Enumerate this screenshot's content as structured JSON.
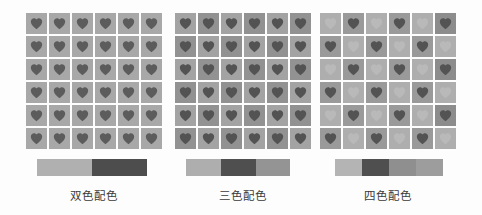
{
  "figure": {
    "background_color": "#fdfdfd",
    "grid_rows": 6,
    "grid_cols": 6,
    "icon_name": "heart-icon"
  },
  "panels": [
    {
      "id": "two-color",
      "caption": "双色配色",
      "left": 26,
      "grid_width": 136,
      "swatch_left": 37,
      "swatch_width": 110,
      "palette": [
        "#b0b0b0",
        "#4d4d4d"
      ],
      "swatch_labels": [
        "浅灰",
        "深灰"
      ],
      "swatches": [
        {
          "color": "#b0b0b0",
          "width": 55
        },
        {
          "color": "#4d4d4d",
          "width": 55
        }
      ],
      "tile_bg": [
        [
          "#a8a8a8",
          "#a8a8a8",
          "#a8a8a8",
          "#a8a8a8",
          "#a8a8a8",
          "#a8a8a8"
        ],
        [
          "#a8a8a8",
          "#a8a8a8",
          "#a8a8a8",
          "#a8a8a8",
          "#a8a8a8",
          "#a8a8a8"
        ],
        [
          "#a8a8a8",
          "#a8a8a8",
          "#a8a8a8",
          "#a8a8a8",
          "#a8a8a8",
          "#a8a8a8"
        ],
        [
          "#a8a8a8",
          "#a8a8a8",
          "#a8a8a8",
          "#a8a8a8",
          "#a8a8a8",
          "#a8a8a8"
        ],
        [
          "#a8a8a8",
          "#a8a8a8",
          "#a8a8a8",
          "#a8a8a8",
          "#a8a8a8",
          "#a8a8a8"
        ],
        [
          "#a8a8a8",
          "#a8a8a8",
          "#a8a8a8",
          "#a8a8a8",
          "#a8a8a8",
          "#a8a8a8"
        ]
      ],
      "heart_color": [
        [
          "#5c5c5c",
          "#5c5c5c",
          "#5c5c5c",
          "#5c5c5c",
          "#5c5c5c",
          "#5c5c5c"
        ],
        [
          "#5c5c5c",
          "#5c5c5c",
          "#5c5c5c",
          "#5c5c5c",
          "#5c5c5c",
          "#5c5c5c"
        ],
        [
          "#5c5c5c",
          "#5c5c5c",
          "#5c5c5c",
          "#5c5c5c",
          "#5c5c5c",
          "#5c5c5c"
        ],
        [
          "#5c5c5c",
          "#5c5c5c",
          "#5c5c5c",
          "#5c5c5c",
          "#5c5c5c",
          "#5c5c5c"
        ],
        [
          "#5c5c5c",
          "#5c5c5c",
          "#5c5c5c",
          "#5c5c5c",
          "#5c5c5c",
          "#5c5c5c"
        ],
        [
          "#5c5c5c",
          "#5c5c5c",
          "#5c5c5c",
          "#5c5c5c",
          "#5c5c5c",
          "#5c5c5c"
        ]
      ]
    },
    {
      "id": "three-color",
      "caption": "三色配色",
      "left": 175,
      "grid_width": 136,
      "swatch_left": 186,
      "swatch_width": 104,
      "palette": [
        "#aeaeae",
        "#4f4f4f",
        "#949494"
      ],
      "swatch_labels": [
        "浅灰",
        "深灰",
        "中灰"
      ],
      "swatches": [
        {
          "color": "#aeaeae",
          "width": 35
        },
        {
          "color": "#4f4f4f",
          "width": 35
        },
        {
          "color": "#949494",
          "width": 34
        }
      ],
      "tile_bg": [
        [
          "#a3a3a3",
          "#929292",
          "#a3a3a3",
          "#929292",
          "#a3a3a3",
          "#929292"
        ],
        [
          "#929292",
          "#a3a3a3",
          "#929292",
          "#a3a3a3",
          "#929292",
          "#a3a3a3"
        ],
        [
          "#a3a3a3",
          "#929292",
          "#a3a3a3",
          "#929292",
          "#a3a3a3",
          "#929292"
        ],
        [
          "#929292",
          "#a3a3a3",
          "#929292",
          "#a3a3a3",
          "#929292",
          "#a3a3a3"
        ],
        [
          "#a3a3a3",
          "#929292",
          "#a3a3a3",
          "#929292",
          "#a3a3a3",
          "#929292"
        ],
        [
          "#929292",
          "#a3a3a3",
          "#929292",
          "#a3a3a3",
          "#929292",
          "#a3a3a3"
        ]
      ],
      "heart_color": [
        [
          "#535353",
          "#535353",
          "#535353",
          "#535353",
          "#535353",
          "#535353"
        ],
        [
          "#535353",
          "#535353",
          "#535353",
          "#535353",
          "#535353",
          "#535353"
        ],
        [
          "#535353",
          "#535353",
          "#535353",
          "#535353",
          "#535353",
          "#535353"
        ],
        [
          "#535353",
          "#535353",
          "#535353",
          "#535353",
          "#535353",
          "#535353"
        ],
        [
          "#535353",
          "#535353",
          "#535353",
          "#535353",
          "#535353",
          "#535353"
        ],
        [
          "#535353",
          "#535353",
          "#535353",
          "#535353",
          "#535353",
          "#535353"
        ]
      ]
    },
    {
      "id": "four-color",
      "caption": "四色配色",
      "left": 320,
      "grid_width": 136,
      "swatch_left": 335,
      "swatch_width": 108,
      "palette": [
        "#b4b4b4",
        "#4f4f4f",
        "#8f8f8f",
        "#9d9d9d"
      ],
      "swatch_labels": [
        "浅灰",
        "深灰",
        "中灰",
        "中浅灰"
      ],
      "swatches": [
        {
          "color": "#b4b4b4",
          "width": 27
        },
        {
          "color": "#4f4f4f",
          "width": 27
        },
        {
          "color": "#8f8f8f",
          "width": 27
        },
        {
          "color": "#9d9d9d",
          "width": 27
        }
      ],
      "tile_bg": [
        [
          "#aeaeae",
          "#9a9a9a",
          "#aeaeae",
          "#9a9a9a",
          "#aeaeae",
          "#8c8c8c"
        ],
        [
          "#9a9a9a",
          "#aeaeae",
          "#9a9a9a",
          "#aeaeae",
          "#9a9a9a",
          "#aeaeae"
        ],
        [
          "#aeaeae",
          "#9a9a9a",
          "#aeaeae",
          "#9a9a9a",
          "#aeaeae",
          "#8c8c8c"
        ],
        [
          "#9a9a9a",
          "#aeaeae",
          "#9a9a9a",
          "#aeaeae",
          "#9a9a9a",
          "#aeaeae"
        ],
        [
          "#aeaeae",
          "#9a9a9a",
          "#aeaeae",
          "#9a9a9a",
          "#aeaeae",
          "#8c8c8c"
        ],
        [
          "#9a9a9a",
          "#aeaeae",
          "#9a9a9a",
          "#aeaeae",
          "#9a9a9a",
          "#aeaeae"
        ]
      ],
      "heart_color": [
        [
          "#b9b9b9",
          "#535353",
          "#b9b9b9",
          "#535353",
          "#b9b9b9",
          "#535353"
        ],
        [
          "#535353",
          "#b9b9b9",
          "#535353",
          "#b9b9b9",
          "#535353",
          "#b9b9b9"
        ],
        [
          "#b9b9b9",
          "#535353",
          "#b9b9b9",
          "#535353",
          "#b9b9b9",
          "#535353"
        ],
        [
          "#535353",
          "#b9b9b9",
          "#535353",
          "#b9b9b9",
          "#535353",
          "#b9b9b9"
        ],
        [
          "#b9b9b9",
          "#535353",
          "#b9b9b9",
          "#535353",
          "#b9b9b9",
          "#535353"
        ],
        [
          "#535353",
          "#b9b9b9",
          "#535353",
          "#b9b9b9",
          "#535353",
          "#b9b9b9"
        ]
      ]
    }
  ]
}
